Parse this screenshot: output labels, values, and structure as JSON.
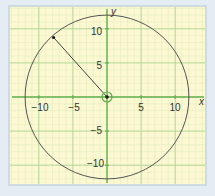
{
  "chart_data": {
    "type": "scatter",
    "title": "",
    "xlabel": "x",
    "ylabel": "y",
    "xlim": [
      -13,
      14
    ],
    "ylim": [
      -13,
      13
    ],
    "xticks": [
      -10,
      -5,
      5,
      10
    ],
    "yticks": [
      10,
      5,
      -5,
      -10
    ],
    "grid": true,
    "minor_grid_step": 1,
    "major_grid_step": 5,
    "shapes": [
      {
        "type": "circle",
        "center": [
          0,
          0
        ],
        "radius": 12.04,
        "label": "circle centred at origin"
      },
      {
        "type": "segment",
        "from": [
          0,
          0
        ],
        "to": [
          -8,
          9
        ],
        "label": "radius"
      }
    ],
    "points": [
      {
        "x": 0,
        "y": 0,
        "label": "centre",
        "highlighted": true
      },
      {
        "x": -8,
        "y": 9,
        "label": "point on circle"
      }
    ]
  },
  "labels": {
    "x_axis": "x",
    "y_axis": "y",
    "xticks": [
      "−10",
      "−5",
      "5",
      "10"
    ],
    "yticks": [
      "10",
      "5",
      "−5",
      "−10"
    ]
  },
  "colors": {
    "background": "#e4edf3",
    "panel": "#fbf8d2",
    "panel_border": "#c3d3de",
    "minor_grid": "#e3ecb8",
    "major_grid": "#a8cf8a",
    "axis": "#5cae4a",
    "curve": "#555555",
    "point": "#1c1c1c"
  }
}
